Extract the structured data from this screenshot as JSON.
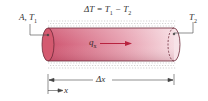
{
  "labels": {
    "area_temp_left": {
      "main": "A, T",
      "sub": "1"
    },
    "delta_t_equation": {
      "left": "ΔT = T",
      "sub1": "1",
      "mid": " − T",
      "sub2": "2"
    },
    "temp_right": {
      "main": "T",
      "sub": "2"
    },
    "heat_flow": {
      "main": "q",
      "sub": "x"
    },
    "length": "Δx",
    "axis": "x"
  },
  "colors": {
    "cylinder_dark": "#c94a62",
    "cylinder_light": "#f4d3da",
    "end_cap": "#d45a70",
    "arrow": "#b8233f",
    "insulation": "#b5b5b5",
    "lines": "#333333"
  }
}
